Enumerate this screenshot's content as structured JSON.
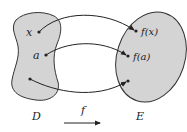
{
  "diagram": {
    "domain_set": {
      "label": "D",
      "fill": "#d4d4d4",
      "stroke": "#333333"
    },
    "codomain_set": {
      "label": "E",
      "fill": "#d4d4d4",
      "stroke": "#333333"
    },
    "function_label": "f",
    "points": [
      {
        "from_label": "x",
        "to_label": "f(x)"
      },
      {
        "from_label": "a",
        "to_label": "f(a)"
      },
      {
        "from_label": "",
        "to_label": ""
      }
    ],
    "colors": {
      "line": "#222222",
      "background": "#ffffff"
    }
  }
}
